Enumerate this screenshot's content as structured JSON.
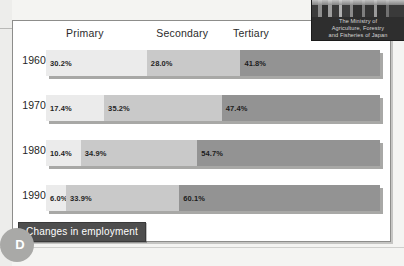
{
  "figure": {
    "caption": "Changes in employment",
    "section_badge": "D"
  },
  "logo": {
    "line1": "The Ministry of",
    "line2": "Agriculture, Forestry",
    "line3": "and Fisheries of Japan",
    "photo_name": "ministry-building-photo"
  },
  "chart_data": {
    "type": "bar",
    "title": "Changes in employment",
    "xlabel": "",
    "ylabel": "",
    "orientation": "horizontal",
    "stacked": true,
    "normalized": true,
    "xlim": [
      0,
      100
    ],
    "grid": false,
    "legend_position": "top",
    "categories": [
      "1960",
      "1970",
      "1980",
      "1990"
    ],
    "series": [
      {
        "name": "Primary",
        "color": "#ebebeb",
        "values": [
          30.2,
          17.4,
          10.4,
          6.0
        ],
        "labels": [
          "30.2%",
          "17.4%",
          "10.4%",
          "6.0%"
        ]
      },
      {
        "name": "Secondary",
        "color": "#c9c9c9",
        "values": [
          28.0,
          35.2,
          34.9,
          33.9
        ],
        "labels": [
          "28.0%",
          "35.2%",
          "34.9%",
          "33.9%"
        ]
      },
      {
        "name": "Tertiary",
        "color": "#939393",
        "values": [
          41.8,
          47.4,
          54.7,
          60.1
        ],
        "labels": [
          "41.8%",
          "47.4%",
          "54.7%",
          "60.1%"
        ]
      }
    ],
    "column_headers": [
      {
        "label": "Primary",
        "left_pct": 6
      },
      {
        "label": "Secondary",
        "left_pct": 33
      },
      {
        "label": "Tertiary",
        "left_pct": 56
      }
    ]
  }
}
